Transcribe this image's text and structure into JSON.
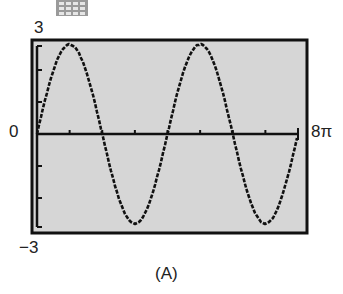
{
  "figure": {
    "caption": "(A)",
    "labels": {
      "y_max": "3",
      "y_zero": "0",
      "x_max": "8π",
      "y_min": "−3"
    },
    "icon": "calculator-grid-icon",
    "colors": {
      "screen_bg": "#d6d6d6",
      "ink": "#111111",
      "icon": "#9a9a9a"
    }
  },
  "chart_data": {
    "type": "line",
    "title": "",
    "caption": "(A)",
    "xlabel": "",
    "ylabel": "",
    "xlim": [
      0,
      25.1327
    ],
    "xlim_labels": [
      "0",
      "8π"
    ],
    "ylim": [
      -3,
      3
    ],
    "ylim_labels": [
      "−3",
      "3"
    ],
    "x_tick_spacing": "π",
    "y_tick_spacing": 1,
    "grid": false,
    "legend": null,
    "series": [
      {
        "name": "y ≈ 2.8 sin(x/2)",
        "amplitude": 2.8,
        "period": "4π",
        "x": [
          0,
          3.1416,
          6.2832,
          9.4248,
          12.5664,
          15.708,
          18.8496,
          21.9911,
          25.1327
        ],
        "x_labels": [
          "0",
          "π",
          "2π",
          "3π",
          "4π",
          "5π",
          "6π",
          "7π",
          "8π"
        ],
        "y": [
          0,
          2.8,
          0,
          -2.8,
          0,
          2.8,
          0,
          -2.8,
          0
        ]
      }
    ]
  }
}
